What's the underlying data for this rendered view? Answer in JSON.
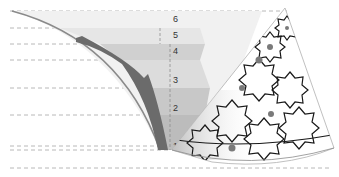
{
  "diagram": {
    "type": "layered-dome-section",
    "level_labels": [
      "1",
      "2",
      "3",
      "4",
      "5",
      "6"
    ],
    "colors": {
      "background": "#ffffff",
      "dashed_line": "#9a9a9a",
      "band_light": "#eeeeee",
      "band_mid": "#d6d6d6",
      "band_dark": "#c2c2c2",
      "shell": "#6e6e6e",
      "pattern_stroke": "#1a1a1a",
      "dot": "#777777"
    }
  }
}
